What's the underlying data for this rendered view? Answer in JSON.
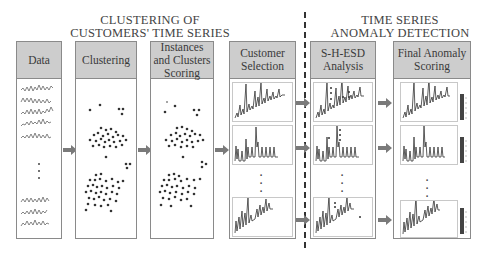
{
  "sections": {
    "clustering_title": [
      "CLUSTERING OF",
      "CUSTOMERS' TIME SERIES"
    ],
    "anomaly_title": [
      "TIME SERIES",
      "ANOMALY DETECTION"
    ]
  },
  "panels": [
    {
      "id": "data",
      "label": "Data"
    },
    {
      "id": "clustering",
      "label": "Clustering"
    },
    {
      "id": "scoring",
      "label_lines": [
        "Instances",
        "and Clusters",
        "Scoring"
      ]
    },
    {
      "id": "customer-selection",
      "label_lines": [
        "Customer",
        "Selection"
      ]
    },
    {
      "id": "shesd",
      "label_lines": [
        "S-H-ESD",
        "Analysis"
      ]
    },
    {
      "id": "final",
      "label_lines": [
        "Final Anomaly",
        "Scoring"
      ]
    }
  ],
  "ellipsis": "⋮",
  "colors": {
    "header_fill": "#cdcdcd",
    "border": "#8a8a8a",
    "arrow": "#7a7a7a",
    "ink": "#333333"
  }
}
